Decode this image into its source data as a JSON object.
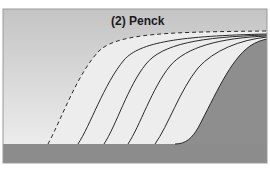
{
  "diagram": {
    "title": "(2) Penck",
    "colors": {
      "sky_top": "#c4c4c4",
      "sky_bottom": "#ececec",
      "slope_fill": "#ededed",
      "hill_fill": "#8e8e8e",
      "ground_fill": "#8c8c8c",
      "line": "#2a2a2a",
      "frame": "#9a9a9a"
    },
    "profiles": [
      {
        "style": "dashed",
        "label": "initial-profile"
      },
      {
        "style": "solid",
        "label": "profile-2"
      },
      {
        "style": "solid",
        "label": "profile-3"
      },
      {
        "style": "solid",
        "label": "profile-4"
      },
      {
        "style": "solid",
        "label": "profile-5"
      },
      {
        "style": "solid",
        "label": "profile-6-hill-surface"
      }
    ]
  }
}
